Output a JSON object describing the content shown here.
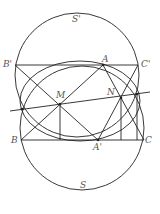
{
  "diagram": {
    "labels": {
      "S_prime": "S'",
      "S": "S",
      "B_prime": "B'",
      "A": "A",
      "C_prime": "C'",
      "M": "M",
      "N": "N",
      "B": "B",
      "A_prime": "A'",
      "C": "C"
    },
    "stroke_color": "#222222"
  }
}
